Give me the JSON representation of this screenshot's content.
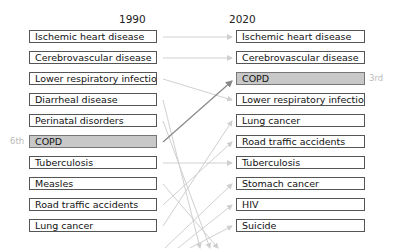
{
  "left": {
    "year": "1990",
    "items": [
      "Ischemic heart disease",
      "Cerebrovascular disease",
      "Lower respiratory infection",
      "Diarrheal disease",
      "Perinatal disorders",
      "COPD",
      "Tuberculosis",
      "Measles",
      "Road traffic accidents",
      "Lung cancer"
    ],
    "highlight_index": 5,
    "highlight_rank": "6th"
  },
  "right": {
    "year": "2020",
    "items": [
      "Ischemic heart disease",
      "Cerebrovascular disease",
      "COPD",
      "Lower respiratory infection",
      "Lung cancer",
      "Road traffic accidents",
      "Tuberculosis",
      "Stomach cancer",
      "HIV",
      "Suicide"
    ],
    "highlight_index": 2,
    "highlight_rank": "3rd"
  },
  "colors": {
    "arrow": "#cfcfcf",
    "highlight_arrow": "#888888",
    "highlight_fill": "#c8c8c8"
  }
}
